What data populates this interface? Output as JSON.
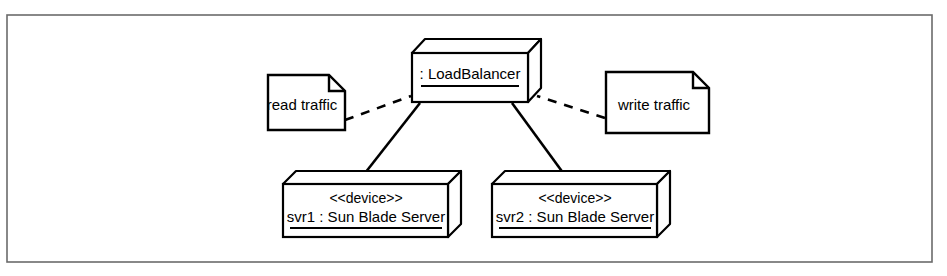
{
  "diagram": {
    "type": "uml-deployment-diagram",
    "frame": {
      "stroke_color": "#555555",
      "background_color": "#ffffff"
    },
    "stroke_color": "#000000",
    "nodes": [
      {
        "id": "loadbalancer",
        "kind": "node",
        "stereotype": "",
        "label": ": LoadBalancer",
        "underlined": true
      },
      {
        "id": "svr1",
        "kind": "device",
        "stereotype": "<<device>>",
        "label": "svr1 : Sun Blade Server",
        "underlined": true
      },
      {
        "id": "svr2",
        "kind": "device",
        "stereotype": "<<device>>",
        "label": "svr2 : Sun Blade Server",
        "underlined": true
      }
    ],
    "notes": [
      {
        "id": "read-note",
        "text": "read traffic",
        "anchored_to": "loadbalancer",
        "anchor_style": "dashed"
      },
      {
        "id": "write-note",
        "text": "write traffic",
        "anchored_to": "loadbalancer",
        "anchor_style": "dashed"
      }
    ],
    "connections": [
      {
        "id": "lb-to-svr1",
        "from": "loadbalancer",
        "to": "svr1",
        "style": "solid"
      },
      {
        "id": "lb-to-svr2",
        "from": "loadbalancer",
        "to": "svr2",
        "style": "solid"
      }
    ]
  }
}
